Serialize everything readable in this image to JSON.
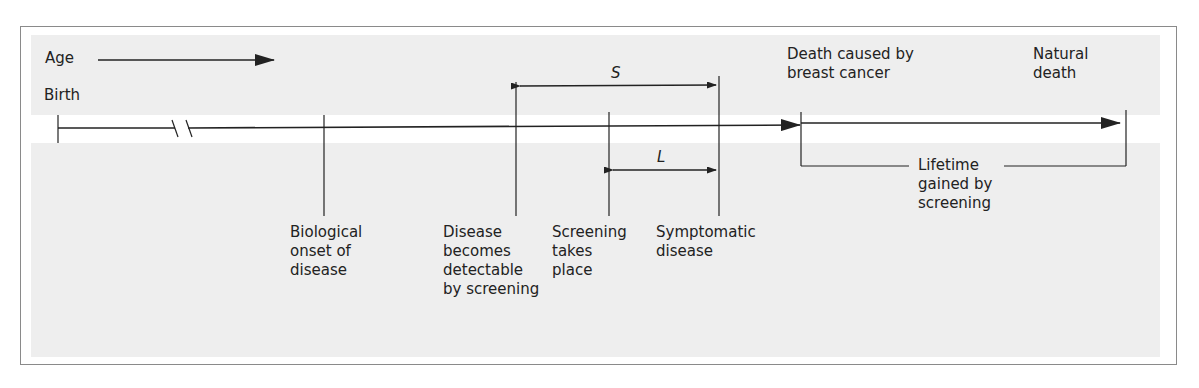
{
  "diagram": {
    "age_label": "Age",
    "birth_label": "Birth",
    "events": [
      {
        "id": "onset",
        "lines": [
          "Biological",
          "onset of",
          "disease"
        ]
      },
      {
        "id": "detectable",
        "lines": [
          "Disease",
          "becomes",
          "detectable",
          "by screening"
        ]
      },
      {
        "id": "screening",
        "lines": [
          "Screening",
          "takes",
          "place"
        ]
      },
      {
        "id": "symptomatic",
        "lines": [
          "Symptomatic",
          "disease"
        ]
      }
    ],
    "death_cancer": [
      "Death caused by",
      "breast cancer"
    ],
    "natural_death": [
      "Natural",
      "death"
    ],
    "lifetime_gained": [
      "Lifetime",
      "gained by",
      "screening"
    ],
    "interval_s": "S",
    "interval_l": "L",
    "colors": {
      "background": "#eeeeee",
      "band": "#ffffff",
      "line": "#222222",
      "frame": "#8a8a8a"
    }
  }
}
